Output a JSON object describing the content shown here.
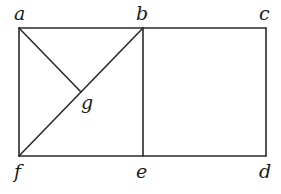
{
  "diagram": {
    "type": "geometric figure",
    "labels": {
      "a": "a",
      "b": "b",
      "c": "c",
      "d": "d",
      "e": "e",
      "f": "f",
      "g": "g"
    },
    "points": {
      "a": [
        19,
        28
      ],
      "b": [
        143,
        28
      ],
      "c": [
        266,
        28
      ],
      "d": [
        266,
        156
      ],
      "e": [
        143,
        156
      ],
      "f": [
        19,
        156
      ],
      "g": [
        81,
        92
      ]
    },
    "segments": [
      [
        "a",
        "c"
      ],
      [
        "c",
        "d"
      ],
      [
        "d",
        "f"
      ],
      [
        "f",
        "a"
      ],
      [
        "b",
        "e"
      ],
      [
        "f",
        "b"
      ],
      [
        "a",
        "g"
      ]
    ],
    "colors": {
      "line": "#2a2a2a",
      "text": "#1a1a1a",
      "background": "#ffffff"
    }
  }
}
